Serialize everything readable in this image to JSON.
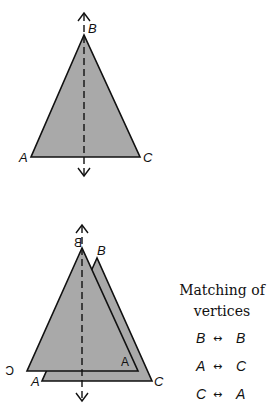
{
  "colors": {
    "fill": "#a9a9a9",
    "stroke": "#111111",
    "background": "#ffffff"
  },
  "top_figure": {
    "labels": {
      "B": "B",
      "A": "A",
      "C": "C"
    },
    "axis": "line of reflection (dashed) with arrows at both ends"
  },
  "bottom_figure": {
    "original_labels": {
      "B": "B",
      "A": "A",
      "C": "C"
    },
    "reflected_labels": {
      "B": "B",
      "A": "A",
      "C": "C"
    },
    "note": "reflected labels are drawn mirrored"
  },
  "matching": {
    "title_line1": "Matching of",
    "title_line2": "vertices",
    "arrow": "↔",
    "pairs": [
      {
        "left": "B",
        "right": "B"
      },
      {
        "left": "A",
        "right": "C"
      },
      {
        "left": "C",
        "right": "A"
      }
    ]
  }
}
